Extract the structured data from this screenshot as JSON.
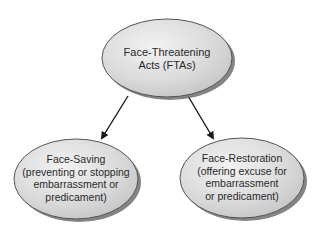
{
  "diagram": {
    "type": "hierarchy",
    "colors": {
      "node_fill_light": "#ececec",
      "node_fill_dark": "#c8c8c8",
      "node_stroke": "#555555",
      "shadow": "#6e6e6e",
      "arrow": "#1a1a1a",
      "text": "#2a2a2a",
      "background": "#ffffff"
    },
    "nodes": [
      {
        "id": "fta",
        "lines": [
          "Face-Threatening",
          "Acts (FTAs)"
        ],
        "cx": 167,
        "cy": 58,
        "rx": 65,
        "ry": 39
      },
      {
        "id": "face-saving",
        "lines": [
          "Face-Saving",
          "(preventing or stopping",
          "embarrassment or",
          "predicament)"
        ],
        "cx": 76,
        "cy": 179,
        "rx": 62,
        "ry": 40
      },
      {
        "id": "face-restoration",
        "lines": [
          "Face-Restoration",
          "(offering excuse for",
          "embarrassment",
          "or predicament)"
        ],
        "cx": 242,
        "cy": 178,
        "rx": 62,
        "ry": 40
      }
    ],
    "edges": [
      {
        "from": "fta",
        "to": "face-saving"
      },
      {
        "from": "fta",
        "to": "face-restoration"
      }
    ]
  }
}
